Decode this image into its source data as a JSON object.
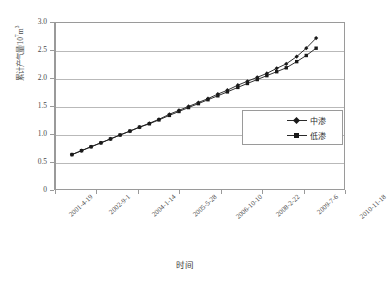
{
  "chart_data": {
    "type": "line",
    "title": "",
    "xlabel": "时间",
    "ylabel": "累计产气量/10⁷m³",
    "ylim": [
      0,
      3.0
    ],
    "yticks": [
      0,
      0.5,
      1.0,
      1.5,
      2.0,
      2.5,
      3.0
    ],
    "ytick_labels": [
      "0",
      "0.5",
      "1.0",
      "1.5",
      "2.0",
      "2.5",
      "3.0"
    ],
    "xtick_labels": [
      "2001-4-19",
      "2002-9-1",
      "2004-1-14",
      "2005-5-28",
      "2006-10-10",
      "2008-2-22",
      "2009-7-6",
      "2010-11-18"
    ],
    "grid": "horizontal",
    "legend_position": "inside-right",
    "series": [
      {
        "name": "中渗",
        "marker": "diamond",
        "color": "#1a1a1a",
        "x": [
          0.055,
          0.088,
          0.121,
          0.155,
          0.188,
          0.221,
          0.255,
          0.288,
          0.322,
          0.355,
          0.391,
          0.424,
          0.457,
          0.491,
          0.524,
          0.558,
          0.591,
          0.627,
          0.66,
          0.694,
          0.727,
          0.761,
          0.794,
          0.83,
          0.863,
          0.897
        ],
        "values": [
          0.65,
          0.72,
          0.79,
          0.86,
          0.93,
          1.0,
          1.07,
          1.14,
          1.21,
          1.28,
          1.37,
          1.44,
          1.51,
          1.58,
          1.65,
          1.73,
          1.8,
          1.89,
          1.96,
          2.03,
          2.1,
          2.19,
          2.27,
          2.4,
          2.55,
          2.73
        ]
      },
      {
        "name": "低渗",
        "marker": "square",
        "color": "#1a1a1a",
        "x": [
          0.055,
          0.088,
          0.121,
          0.155,
          0.188,
          0.221,
          0.255,
          0.288,
          0.322,
          0.355,
          0.391,
          0.424,
          0.457,
          0.491,
          0.524,
          0.558,
          0.591,
          0.627,
          0.66,
          0.694,
          0.727,
          0.761,
          0.794,
          0.83,
          0.863,
          0.897
        ],
        "values": [
          0.65,
          0.72,
          0.79,
          0.86,
          0.93,
          1.0,
          1.07,
          1.14,
          1.2,
          1.27,
          1.35,
          1.42,
          1.49,
          1.56,
          1.63,
          1.7,
          1.77,
          1.85,
          1.92,
          1.99,
          2.06,
          2.13,
          2.2,
          2.31,
          2.42,
          2.55
        ]
      }
    ]
  },
  "legend": {
    "entries": [
      {
        "label": "中渗"
      },
      {
        "label": "低渗"
      }
    ]
  },
  "axes": {
    "y_title": "累计产气量/10",
    "y_title_sup": "7",
    "y_title_unit": "m",
    "y_title_unit_sup": "3",
    "x_title": "时间"
  }
}
